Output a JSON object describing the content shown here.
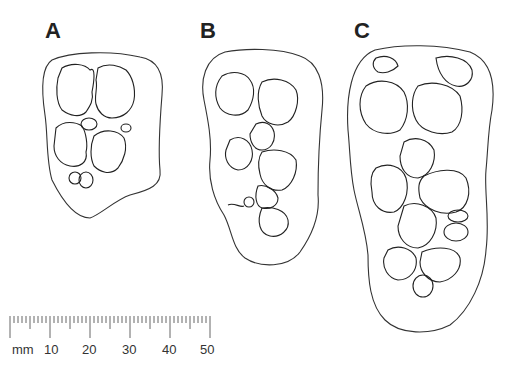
{
  "figure": {
    "panels": [
      {
        "label": "A",
        "x": 45,
        "y": 18
      },
      {
        "label": "B",
        "x": 200,
        "y": 18
      },
      {
        "label": "C",
        "x": 352,
        "y": 18
      }
    ],
    "scale_bar": {
      "unit": "mm",
      "tick_labels": [
        "10",
        "20",
        "30",
        "40",
        "50"
      ],
      "range_mm": [
        0,
        50
      ],
      "minor_tick_mm": 1
    }
  }
}
